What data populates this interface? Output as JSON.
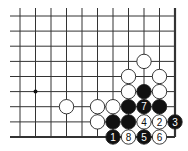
{
  "diagram": {
    "columns": 11,
    "rows": 9,
    "x_coords": [
      20,
      35.5,
      51,
      66.5,
      82,
      97.5,
      113,
      128.5,
      144,
      159.5,
      175
    ],
    "y_coords": [
      16,
      31.1,
      46.2,
      61.4,
      76.5,
      91.6,
      106.7,
      121.9,
      137
    ],
    "edges": {
      "right": true,
      "bottom": true,
      "top": false,
      "left": false
    },
    "star_points": [
      {
        "col": 1,
        "row": 5
      }
    ],
    "colors": {
      "line": "#333333",
      "black_stone": "#111111",
      "white_stone": "#ffffff",
      "stone_outline": "#222222"
    },
    "stones": [
      {
        "col": 8,
        "row": 3,
        "color": "white",
        "label": ""
      },
      {
        "col": 7,
        "row": 4,
        "color": "white",
        "label": ""
      },
      {
        "col": 9,
        "row": 4,
        "color": "white",
        "label": ""
      },
      {
        "col": 7,
        "row": 5,
        "color": "white",
        "label": ""
      },
      {
        "col": 8,
        "row": 5,
        "color": "black",
        "label": ""
      },
      {
        "col": 9,
        "row": 5,
        "color": "white",
        "label": ""
      },
      {
        "col": 3,
        "row": 6,
        "color": "white",
        "label": ""
      },
      {
        "col": 5,
        "row": 6,
        "color": "white",
        "label": ""
      },
      {
        "col": 6,
        "row": 6,
        "color": "white",
        "label": ""
      },
      {
        "col": 7,
        "row": 6,
        "color": "black",
        "label": ""
      },
      {
        "col": 8,
        "row": 6,
        "color": "black",
        "label": "7"
      },
      {
        "col": 9,
        "row": 6,
        "color": "black",
        "label": ""
      },
      {
        "col": 5,
        "row": 7,
        "color": "white",
        "label": ""
      },
      {
        "col": 6,
        "row": 7,
        "color": "black",
        "label": ""
      },
      {
        "col": 7,
        "row": 7,
        "color": "black",
        "label": ""
      },
      {
        "col": 8,
        "row": 7,
        "color": "white",
        "label": "4"
      },
      {
        "col": 9,
        "row": 7,
        "color": "white",
        "label": "2"
      },
      {
        "col": 10,
        "row": 7,
        "color": "black",
        "label": "3"
      },
      {
        "col": 6,
        "row": 8,
        "color": "black",
        "label": "1"
      },
      {
        "col": 7,
        "row": 8,
        "color": "white",
        "label": "8"
      },
      {
        "col": 8,
        "row": 8,
        "color": "black",
        "label": "5"
      },
      {
        "col": 9,
        "row": 8,
        "color": "white",
        "label": "6"
      }
    ]
  }
}
